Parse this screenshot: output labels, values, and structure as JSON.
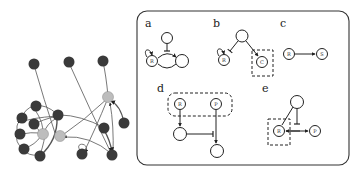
{
  "network": {
    "dark_node_color": "#3a3a3a",
    "hub_node_color": "#bdbdbd",
    "edge_color": "#555555"
  },
  "panel": {
    "border_color": "#333333",
    "subfigures": [
      {
        "label": "a",
        "nodes": [
          "",
          "R",
          ""
        ],
        "description": "inhibitor node blocks edge between R (with self-loop) and another node"
      },
      {
        "label": "b",
        "nodes": [
          "",
          "R",
          "C"
        ],
        "description": "node inhibits R (self-loop), activates C in dashed box"
      },
      {
        "label": "c",
        "nodes": [
          "R",
          "S"
        ],
        "description": "R activates S"
      },
      {
        "label": "d",
        "nodes": [
          "R",
          "P",
          "",
          ""
        ],
        "description": "R and P grouped in dashed box; downstream inhibition"
      },
      {
        "label": "e",
        "nodes": [
          "",
          "R",
          "P"
        ],
        "description": "R in dashed box, bidirectional with P, inhibited from top node"
      }
    ]
  },
  "text": {
    "a": "a",
    "b": "b",
    "c": "c",
    "d": "d",
    "e": "e",
    "R": "R",
    "S": "S",
    "C": "C",
    "P": "P"
  }
}
